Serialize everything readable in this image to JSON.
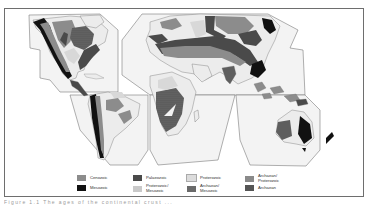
{
  "map": {
    "title": "Geological age of continental crust (interrupted world projection)",
    "colors": {
      "land": "#ececec",
      "outline": "#6e6e6e",
      "cenozoic": "#8c8c8c",
      "mesozoic": "#111111",
      "palaeozoic": "#4a4a4a",
      "proterozoic": "#d8d8d8",
      "archaean_proterozoic": "#7a7a7a",
      "archaean_mesozoic": "#5e5e5e",
      "proterozoic_mesozoic": "#c9c9c9",
      "archaean": "#555555"
    }
  },
  "legend": {
    "items": [
      {
        "label": "Cenozoic",
        "swatch": "#8c8c8c",
        "pattern": "solid"
      },
      {
        "label": "Mesozoic",
        "swatch": "#111111",
        "pattern": "solid"
      },
      {
        "label": "Palaeozoic",
        "swatch": "#4a4a4a",
        "pattern": "solid"
      },
      {
        "label": "Proterozoic/ Mesozoic",
        "swatch": "#c9c9c9",
        "pattern": "dotted"
      },
      {
        "label": "Proterozoic",
        "swatch": "#dcdcdc",
        "pattern": "solid"
      },
      {
        "label": "Archaean/ Mesozoic",
        "swatch": "#6a6a6a",
        "pattern": "solid"
      },
      {
        "label": "Archaean/ Proterozoic",
        "swatch": "#8a8a8a",
        "pattern": "solid"
      },
      {
        "label": "Archaean",
        "swatch": "#555555",
        "pattern": "dotted"
      }
    ]
  },
  "caption": {
    "text": "Figure 1.1 The ages of the continental crust ..."
  }
}
